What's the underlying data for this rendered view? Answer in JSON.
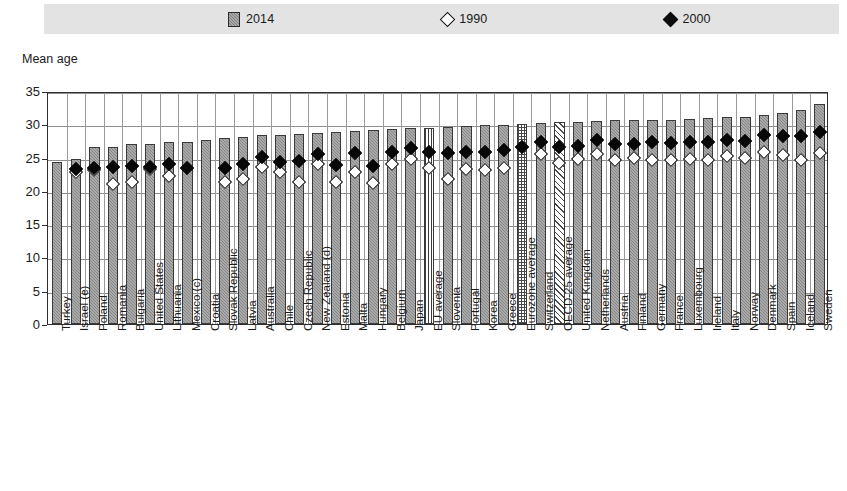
{
  "legend": {
    "items": [
      {
        "label": "2014",
        "marker": "bar-swatch",
        "color": "#7d7d7d"
      },
      {
        "label": "1990",
        "marker": "open-diamond",
        "color": "#ffffff"
      },
      {
        "label": "2000",
        "marker": "filled-diamond",
        "color": "#0d0d0d"
      }
    ]
  },
  "axis": {
    "y_title": "Mean age",
    "y_ticks": [
      "0",
      "5",
      "10",
      "15",
      "20",
      "25",
      "30",
      "35"
    ],
    "ylim": [
      0,
      35
    ]
  },
  "chart_data": {
    "type": "bar",
    "title": "Mean age",
    "xlabel": "",
    "ylabel": "Mean age",
    "ylim": [
      0,
      35
    ],
    "grid": true,
    "legend_position": "top",
    "categories": [
      "Turkey",
      "Israel (e)",
      "Poland",
      "Romania",
      "Bulgaria",
      "United States",
      "Lithuania",
      "Mexico (c)",
      "Croatia",
      "Slovak Republic",
      "Latvia",
      "Australia",
      "Chile",
      "Czech Republic",
      "New Zealand (d)",
      "Estonia",
      "Malta",
      "Hungary",
      "Belgium",
      "Japan",
      "EU average",
      "Slovenia",
      "Portugal",
      "Korea",
      "Greece",
      "Eurozone average",
      "Switzerland",
      "OECD-25 average",
      "United Kingdom",
      "Netherlands",
      "Austria",
      "Finland",
      "Germany",
      "France",
      "Luxembourg",
      "Ireland",
      "Italy",
      "Norway",
      "Denmark",
      "Spain",
      "Iceland",
      "Sweden"
    ],
    "series": [
      {
        "name": "2014",
        "type": "bar",
        "values": [
          24.3,
          24.8,
          26.6,
          26.6,
          27.0,
          27.0,
          27.3,
          27.4,
          27.6,
          27.9,
          28.1,
          28.4,
          28.4,
          28.5,
          28.7,
          28.8,
          29.0,
          29.1,
          29.3,
          29.5,
          29.5,
          29.6,
          29.7,
          29.9,
          29.9,
          30.0,
          30.2,
          30.3,
          30.4,
          30.5,
          30.6,
          30.6,
          30.7,
          30.7,
          30.8,
          31.0,
          31.1,
          31.1,
          31.4,
          31.7,
          32.2,
          33.0
        ]
      },
      {
        "name": "1990",
        "type": "scatter",
        "marker": "open-diamond",
        "values": [
          null,
          23.5,
          23.8,
          21.6,
          21.9,
          23.9,
          22.8,
          null,
          null,
          22.0,
          22.4,
          24.2,
          23.5,
          22.0,
          24.6,
          22.0,
          23.5,
          21.8,
          24.6,
          25.4,
          24.0,
          22.4,
          23.9,
          23.8,
          24.1,
          null,
          26.1,
          24.8,
          25.4,
          26.2,
          25.2,
          25.5,
          25.3,
          25.3,
          25.4,
          25.2,
          25.8,
          25.6,
          26.4,
          26.0,
          25.3,
          26.3
        ]
      },
      {
        "name": "2000",
        "type": "scatter",
        "marker": "filled-diamond",
        "values": [
          null,
          23.9,
          24.1,
          24.2,
          24.3,
          24.2,
          24.7,
          24.1,
          null,
          24.0,
          24.7,
          25.7,
          25.0,
          25.1,
          26.2,
          24.5,
          26.3,
          24.3,
          26.4,
          27.0,
          26.5,
          26.3,
          26.4,
          26.4,
          26.8,
          27.2,
          28.0,
          27.2,
          27.4,
          28.2,
          27.7,
          27.6,
          27.9,
          27.8,
          27.9,
          27.9,
          28.3,
          28.1,
          29.0,
          28.9,
          28.9,
          29.4
        ]
      }
    ],
    "bar_styles": {
      "EU average": "vertical-stripe",
      "Eurozone average": "checkered",
      "OECD-25 average": "diagonal-stripe"
    }
  }
}
